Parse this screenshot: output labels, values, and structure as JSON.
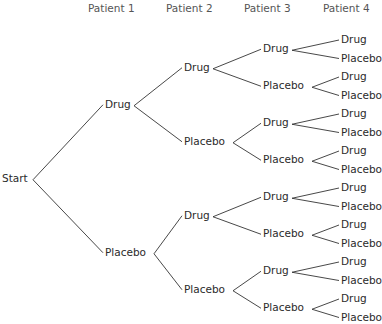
{
  "diagram": {
    "type": "tree",
    "headers": [
      "Patient 1",
      "Patient 2",
      "Patient 3",
      "Patient 4"
    ],
    "root": "Start",
    "branch_labels": [
      "Drug",
      "Placebo"
    ],
    "levels": {
      "patient1": [
        "Drug",
        "Placebo"
      ],
      "patient2": [
        "Drug",
        "Placebo",
        "Drug",
        "Placebo"
      ],
      "patient3": [
        "Drug",
        "Placebo",
        "Drug",
        "Placebo",
        "Drug",
        "Placebo",
        "Drug",
        "Placebo"
      ],
      "patient4": [
        "Drug",
        "Placebo",
        "Drug",
        "Placebo",
        "Drug",
        "Placebo",
        "Drug",
        "Placebo",
        "Drug",
        "Placebo",
        "Drug",
        "Placebo",
        "Drug",
        "Placebo",
        "Drug",
        "Placebo"
      ]
    },
    "line_color": "#333333"
  }
}
